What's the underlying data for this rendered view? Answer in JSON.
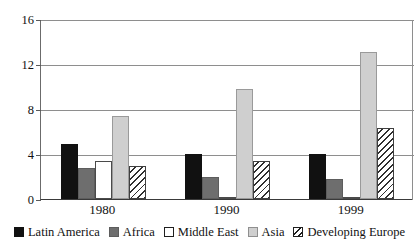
{
  "chart_data": {
    "type": "bar",
    "title": "",
    "subtitle": "",
    "xlabel": "",
    "ylabel": "",
    "categories": [
      "1980",
      "1990",
      "1999"
    ],
    "series": [
      {
        "name": "Latin America",
        "color": "#111111",
        "pattern": "solid-black",
        "values": [
          4.9,
          4.0,
          4.0
        ]
      },
      {
        "name": "Africa",
        "color": "#6e6e6e",
        "pattern": "solid-dark-gray",
        "values": [
          2.8,
          2.0,
          1.8
        ]
      },
      {
        "name": "Middle East",
        "color": "#ffffff",
        "pattern": "white-outline",
        "values": [
          3.4,
          0.1,
          0.1
        ]
      },
      {
        "name": "Asia",
        "color": "#cfcfcf",
        "pattern": "solid-light-gray",
        "values": [
          7.4,
          9.8,
          13.1
        ]
      },
      {
        "name": "Developing Europe",
        "color": "#ffffff",
        "pattern": "diagonal-hatch",
        "values": [
          2.9,
          3.4,
          6.3
        ]
      }
    ],
    "ylim": [
      0,
      16
    ],
    "yticks": [
      0,
      4,
      8,
      12,
      16
    ],
    "ytick_labels": [
      "0",
      "4",
      "8",
      "12",
      "16"
    ],
    "grid": true,
    "grid_axis": "y",
    "legend_position": "bottom"
  },
  "legend": {
    "items": [
      {
        "label": "Latin America"
      },
      {
        "label": "Africa"
      },
      {
        "label": "Middle East"
      },
      {
        "label": "Asia"
      },
      {
        "label": "Developing Europe"
      }
    ]
  }
}
